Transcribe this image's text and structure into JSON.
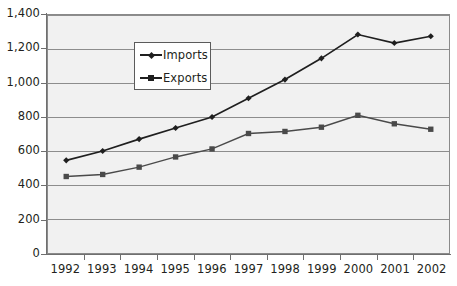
{
  "chart_data": {
    "type": "line",
    "title": "",
    "subtitle": "",
    "xlabel": "",
    "ylabel": "",
    "categories": [
      "1992",
      "1993",
      "1994",
      "1995",
      "1996",
      "1997",
      "1998",
      "1999",
      "2000",
      "2001",
      "2002"
    ],
    "series": [
      {
        "name": "Imports",
        "marker": "diamond",
        "color": "#1f1f1f",
        "values": [
          545,
          600,
          670,
          735,
          800,
          910,
          1020,
          1145,
          1285,
          1235,
          1275
        ]
      },
      {
        "name": "Exports",
        "marker": "square",
        "color": "#4a4a4a",
        "values": [
          450,
          462,
          505,
          565,
          612,
          703,
          715,
          740,
          810,
          760,
          728
        ]
      }
    ],
    "ylim": [
      0,
      1400
    ],
    "y_tick_values": [
      0,
      200,
      400,
      600,
      800,
      1000,
      1200,
      1400
    ],
    "y_tick_labels": [
      "0",
      "200",
      "400",
      "600",
      "800",
      "1,000",
      "1,200",
      "1,400"
    ],
    "grid": true,
    "grid_axis": "y",
    "legend_position": "upper-center-left",
    "plot_background": "#f1f1f1",
    "grid_color": "#8c8c8c",
    "axis_color": "#6f6f6f"
  },
  "legend": {
    "entries": [
      {
        "label": "Imports"
      },
      {
        "label": "Exports"
      }
    ]
  }
}
